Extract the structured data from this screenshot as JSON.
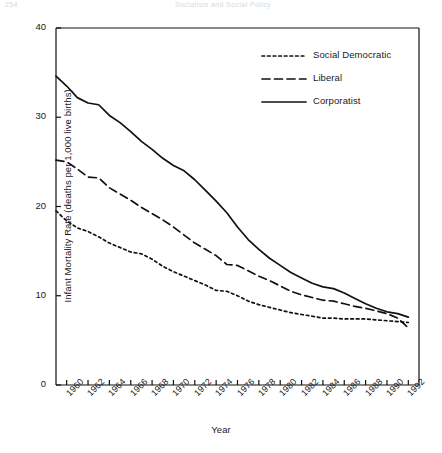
{
  "page_header": {
    "left": "254",
    "center": "Socialism and Social Policy"
  },
  "chart_data": {
    "type": "line",
    "title": "",
    "xlabel": "Year",
    "ylabel": "Infant Mortality Rate (deaths per 1,000 live births)",
    "xlim": [
      1959,
      1993
    ],
    "ylim": [
      0,
      40
    ],
    "yticks": [
      0,
      10,
      20,
      30,
      40
    ],
    "ytick_labels": [
      "0",
      "10",
      "20",
      "30",
      "40"
    ],
    "xticks": [
      1960,
      1962,
      1964,
      1966,
      1968,
      1970,
      1972,
      1974,
      1976,
      1978,
      1980,
      1982,
      1984,
      1986,
      1988,
      1990,
      1992
    ],
    "xtick_labels": [
      "1960",
      "1962",
      "1964",
      "1966",
      "1968",
      "1970",
      "1972",
      "1974",
      "1976",
      "1978",
      "1980",
      "1982",
      "1984",
      "1986",
      "1988",
      "1990",
      "1992"
    ],
    "grid": false,
    "legend_position": "upper right",
    "x": [
      1959,
      1960,
      1961,
      1962,
      1963,
      1964,
      1965,
      1966,
      1967,
      1968,
      1969,
      1970,
      1971,
      1972,
      1973,
      1974,
      1975,
      1976,
      1977,
      1978,
      1979,
      1980,
      1981,
      1982,
      1983,
      1984,
      1985,
      1986,
      1987,
      1988,
      1989,
      1990,
      1991,
      1992
    ],
    "series": [
      {
        "name": "Social Democratic",
        "style": "dotted",
        "color": "#111111",
        "values": [
          19.5,
          18.4,
          17.6,
          17.2,
          16.6,
          15.9,
          15.4,
          14.9,
          14.7,
          14.1,
          13.3,
          12.7,
          12.2,
          11.7,
          11.2,
          10.6,
          10.5,
          10.0,
          9.4,
          9.0,
          8.7,
          8.4,
          8.1,
          7.9,
          7.7,
          7.5,
          7.5,
          7.4,
          7.4,
          7.4,
          7.3,
          7.2,
          7.1,
          7.0
        ]
      },
      {
        "name": "Liberal",
        "style": "dashed",
        "color": "#111111",
        "values": [
          25.2,
          25.0,
          24.2,
          23.3,
          23.2,
          22.1,
          21.4,
          20.7,
          19.9,
          19.2,
          18.5,
          17.7,
          16.8,
          15.9,
          15.2,
          14.5,
          13.5,
          13.4,
          12.8,
          12.2,
          11.7,
          11.1,
          10.5,
          10.1,
          9.8,
          9.5,
          9.4,
          9.1,
          8.8,
          8.6,
          8.3,
          8.0,
          7.5,
          6.4
        ]
      },
      {
        "name": "Corporatist",
        "style": "solid",
        "color": "#111111",
        "values": [
          34.6,
          33.5,
          32.2,
          31.6,
          31.4,
          30.2,
          29.4,
          28.4,
          27.3,
          26.4,
          25.4,
          24.6,
          24.0,
          23.0,
          21.8,
          20.6,
          19.3,
          17.7,
          16.3,
          15.2,
          14.2,
          13.4,
          12.6,
          12.0,
          11.4,
          11.0,
          10.8,
          10.3,
          9.7,
          9.1,
          8.6,
          8.2,
          8.0,
          7.6
        ]
      }
    ]
  },
  "legend": {
    "items": [
      {
        "label": "Social Democratic",
        "style": "dotted"
      },
      {
        "label": "Liberal",
        "style": "dashed"
      },
      {
        "label": "Corporatist",
        "style": "solid"
      }
    ]
  }
}
